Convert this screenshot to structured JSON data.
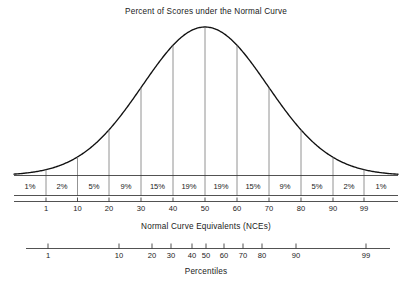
{
  "chart_data": {
    "type": "bar",
    "title": "Percent of Scores under the Normal Curve",
    "subtitle": "",
    "xlabel": "Normal Curve Equivalents (NCEs)",
    "ylabel": "",
    "grid": false,
    "legend": "none",
    "annotations": [
      "Areas under the normal curve divided into twelve segments labeled by percent of scores."
    ],
    "categories": [
      "1%",
      "2%",
      "5%",
      "9%",
      "15%",
      "19%",
      "19%",
      "15%",
      "9%",
      "5%",
      "2%",
      "1%"
    ],
    "values": [
      1,
      2,
      5,
      9,
      15,
      19,
      19,
      15,
      9,
      5,
      2,
      1
    ],
    "band_labels": [
      "1%",
      "2%",
      "5%",
      "9%",
      "15%",
      "19%",
      "19%",
      "15%",
      "9%",
      "5%",
      "2%",
      "1%"
    ],
    "band_boundaries_nce": [
      1,
      10,
      20,
      30,
      40,
      50,
      60,
      70,
      80,
      90,
      99
    ],
    "axes": [
      {
        "name": "nce-axis",
        "label": "Normal Curve Equivalents (NCEs)",
        "scale": "linear",
        "range": [
          1,
          99
        ],
        "ticks": [
          "1",
          "10",
          "20",
          "30",
          "40",
          "50",
          "60",
          "70",
          "80",
          "90",
          "99"
        ],
        "tick_values": [
          1,
          10,
          20,
          30,
          40,
          50,
          60,
          70,
          80,
          90,
          99
        ]
      },
      {
        "name": "percentile-axis",
        "label": "Percentiles",
        "scale": "normal-probability",
        "range": [
          1,
          99
        ],
        "ticks": [
          "1",
          "10",
          "20",
          "30",
          "40",
          "50",
          "60",
          "70",
          "80",
          "90",
          "99"
        ],
        "tick_values": [
          1,
          10,
          20,
          30,
          40,
          50,
          60,
          70,
          80,
          90,
          99
        ]
      }
    ],
    "colors": {
      "curve": "#111111",
      "divider": "#777777",
      "axis": "#333333",
      "text": "#1a1a1a",
      "background": "#ffffff"
    }
  },
  "figure": {
    "title": "Percent of Scores under the Normal Curve",
    "nce_axis_caption": "Normal Curve Equivalents (NCEs)",
    "percentile_axis_caption": "Percentiles",
    "bands": [
      {
        "label": "1%",
        "x": 30.0
      },
      {
        "label": "2%",
        "x": 62.0
      },
      {
        "label": "5%",
        "x": 94.0
      },
      {
        "label": "9%",
        "x": 126.0
      },
      {
        "label": "15%",
        "x": 157.5
      },
      {
        "label": "19%",
        "x": 189.0
      },
      {
        "label": "19%",
        "x": 221.0
      },
      {
        "label": "15%",
        "x": 253.0
      },
      {
        "label": "9%",
        "x": 285.0
      },
      {
        "label": "5%",
        "x": 317.0
      },
      {
        "label": "2%",
        "x": 349.0
      },
      {
        "label": "1%",
        "x": 381.0
      }
    ],
    "nce_ticks": [
      {
        "label": "1",
        "x": 46.0
      },
      {
        "label": "10",
        "x": 77.5
      },
      {
        "label": "20",
        "x": 109.0
      },
      {
        "label": "30",
        "x": 141.0
      },
      {
        "label": "40",
        "x": 173.0
      },
      {
        "label": "50",
        "x": 205.0
      },
      {
        "label": "60",
        "x": 237.0
      },
      {
        "label": "70",
        "x": 269.0
      },
      {
        "label": "80",
        "x": 301.0
      },
      {
        "label": "90",
        "x": 333.0
      },
      {
        "label": "99",
        "x": 364.0
      }
    ],
    "percentile_ticks": [
      {
        "label": "1",
        "x": 48.0
      },
      {
        "label": "10",
        "x": 119.0
      },
      {
        "label": "20",
        "x": 152.0
      },
      {
        "label": "30",
        "x": 171.0
      },
      {
        "label": "40",
        "x": 192.0
      },
      {
        "label": "50",
        "x": 206.0
      },
      {
        "label": "60",
        "x": 224.0
      },
      {
        "label": "70",
        "x": 243.0
      },
      {
        "label": "80",
        "x": 262.0
      },
      {
        "label": "90",
        "x": 296.0
      },
      {
        "label": "99",
        "x": 366.0
      }
    ]
  }
}
